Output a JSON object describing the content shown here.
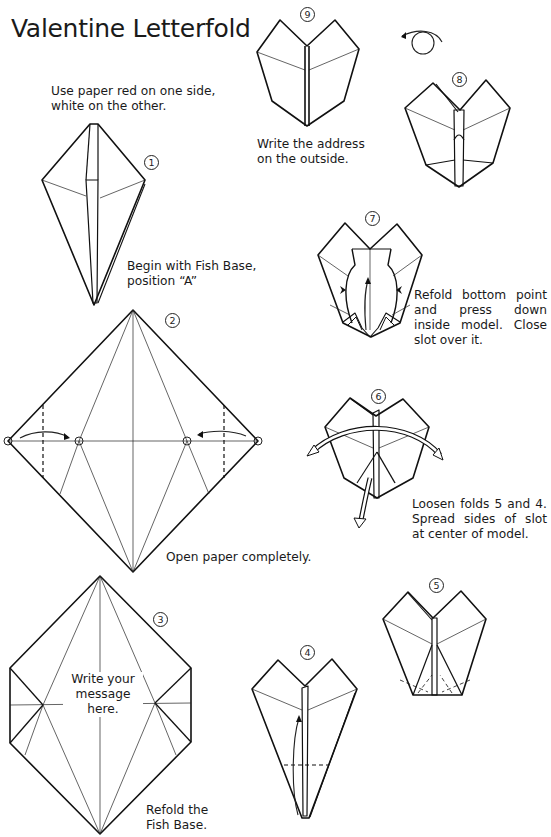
{
  "title": "Valentine Letterfold",
  "intro": "Use paper red on one side, white on the other.",
  "steps": [
    {
      "number": "1",
      "label": "①",
      "caption": "Begin with Fish Base, position “A”"
    },
    {
      "number": "2",
      "label": "②",
      "caption": "Open paper completely."
    },
    {
      "number": "3",
      "label": "③",
      "caption": "Refold the Fish Base.",
      "inner_text": "Write your message here."
    },
    {
      "number": "4",
      "label": "④",
      "caption": ""
    },
    {
      "number": "5",
      "label": "⑤",
      "caption": ""
    },
    {
      "number": "6",
      "label": "⑥",
      "caption": "Loosen folds 5 and 4. Spread sides of slot at center of model."
    },
    {
      "number": "7",
      "label": "⑦",
      "caption": "Refold bottom point and press down inside model. Close slot over it."
    },
    {
      "number": "8",
      "label": "⑧",
      "caption": "",
      "symbol": "turn-over"
    },
    {
      "number": "9",
      "label": "⑨",
      "caption": "Write the address on the outside."
    }
  ]
}
